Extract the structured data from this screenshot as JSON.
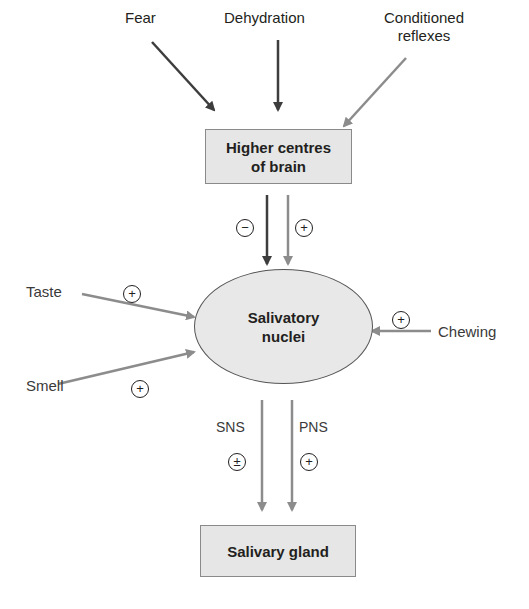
{
  "inputs_top": {
    "fear": "Fear",
    "dehydration": "Dehydration",
    "conditioned_reflexes_line1": "Conditioned",
    "conditioned_reflexes_line2": "reflexes"
  },
  "higher_centres": {
    "line1": "Higher centres",
    "line2": "of brain",
    "inhibit_sign": "−",
    "excite_sign": "+"
  },
  "salivatory_nuclei": {
    "line1": "Salivatory",
    "line2": "nuclei"
  },
  "side_inputs": {
    "taste": {
      "label": "Taste",
      "sign": "+"
    },
    "smell": {
      "label": "Smell",
      "sign": "+"
    },
    "chewing": {
      "label": "Chewing",
      "sign": "+"
    }
  },
  "outputs": {
    "sns": {
      "label": "SNS",
      "sign": "±"
    },
    "pns": {
      "label": "PNS",
      "sign": "+"
    }
  },
  "salivary_gland": {
    "label": "Salivary gland"
  },
  "colors": {
    "dark_arrow": "#3d3d3d",
    "grey_arrow": "#8c8c8c",
    "box_fill": "#e6e6e6",
    "ellipse_fill": "#e8e8e8"
  }
}
